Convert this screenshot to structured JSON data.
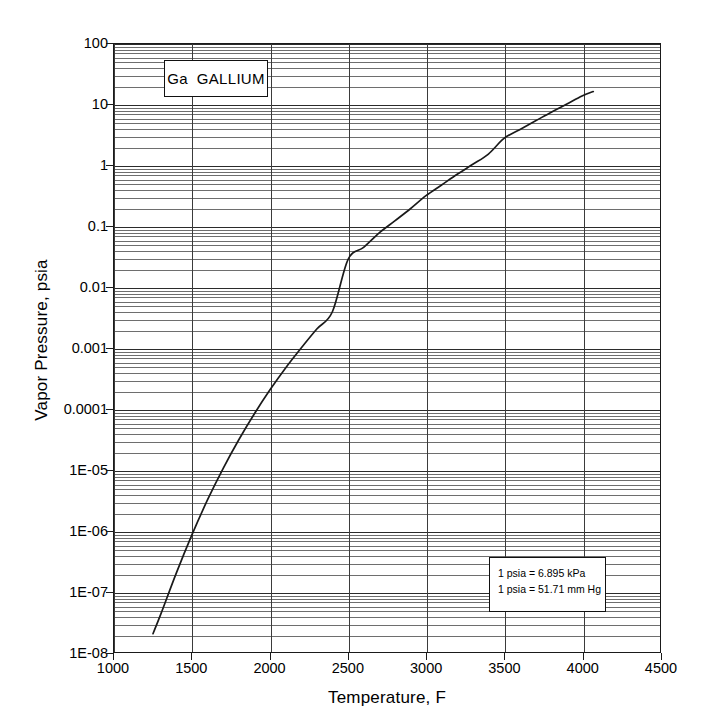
{
  "chart_data": {
    "type": "line",
    "title": "Ga   GALLIUM",
    "xlabel": "Temperature, F",
    "ylabel": "Vapor Pressure, psia",
    "xlim": [
      1000,
      4500
    ],
    "ylim": [
      1e-08,
      100
    ],
    "yscale": "log",
    "xscale": "linear",
    "grid": "major and minor log gridlines, both axes",
    "legend": "none",
    "x_ticks": [
      1000,
      1500,
      2000,
      2500,
      3000,
      3500,
      4000,
      4500
    ],
    "x_tick_labels": [
      "1000",
      "1500",
      "2000",
      "2500",
      "3000",
      "3500",
      "4000",
      "4500"
    ],
    "y_ticks": [
      100,
      10,
      1,
      0.1,
      0.01,
      0.001,
      0.0001,
      1e-05,
      1e-06,
      1e-07,
      1e-08
    ],
    "y_tick_labels": [
      "100",
      "10",
      "1",
      "0.1",
      "0.01",
      "0.001",
      "0.0001",
      "1E-05",
      "1E-06",
      "1E-07",
      "1E-08"
    ],
    "series": [
      {
        "name": "Gallium vapor pressure",
        "color": "#1a1a1a",
        "x": [
          1250,
          1300,
          1400,
          1500,
          1600,
          1700,
          1800,
          1900,
          2000,
          2100,
          2200,
          2300,
          2400,
          2500,
          2600,
          2700,
          2800,
          2900,
          3000,
          3100,
          3200,
          3300,
          3400,
          3500,
          3600,
          3700,
          3800,
          3900,
          4000,
          4072
        ],
        "y": [
          2e-08,
          4.2e-08,
          2e-07,
          8.5e-07,
          3.2e-06,
          1.05e-05,
          3.1e-05,
          8.3e-05,
          0.000205,
          0.00047,
          0.001,
          0.00205,
          0.00395,
          0.0285,
          0.045,
          0.078,
          0.123,
          0.195,
          0.32,
          0.48,
          0.72,
          1.05,
          1.55,
          2.8,
          3.9,
          5.4,
          7.5,
          10.2,
          14.0,
          16.5
        ]
      }
    ],
    "annotations": [
      {
        "name": "element-label",
        "symbol": "Ga",
        "element": "GALLIUM"
      },
      {
        "name": "conversion-note",
        "line1": "1 psia = 6.895 kPa",
        "line2": "1 psia = 51.71 mm Hg"
      }
    ]
  }
}
